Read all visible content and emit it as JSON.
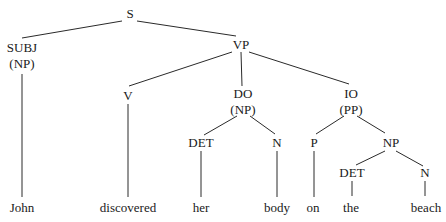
{
  "diagram": {
    "type": "syntax-tree",
    "nodes": [
      {
        "id": "S",
        "label": "S",
        "sub": "",
        "x": 130,
        "y": 18
      },
      {
        "id": "SUBJ",
        "label": "SUBJ",
        "sub": "(NP)",
        "x": 22,
        "y": 51
      },
      {
        "id": "VP",
        "label": "VP",
        "sub": "",
        "x": 241,
        "y": 49
      },
      {
        "id": "V",
        "label": "V",
        "sub": "",
        "x": 128,
        "y": 99
      },
      {
        "id": "DO",
        "label": "DO",
        "sub": "(NP)",
        "x": 243,
        "y": 98
      },
      {
        "id": "IO",
        "label": "IO",
        "sub": "(PP)",
        "x": 351,
        "y": 98
      },
      {
        "id": "DET1",
        "label": "DET",
        "sub": "",
        "x": 201,
        "y": 147
      },
      {
        "id": "N1",
        "label": "N",
        "sub": "",
        "x": 277,
        "y": 147
      },
      {
        "id": "P",
        "label": "P",
        "sub": "",
        "x": 314,
        "y": 147
      },
      {
        "id": "NP2",
        "label": "NP",
        "sub": "",
        "x": 391,
        "y": 147
      },
      {
        "id": "DET2",
        "label": "DET",
        "sub": "",
        "x": 352,
        "y": 177
      },
      {
        "id": "N2",
        "label": "N",
        "sub": "",
        "x": 425,
        "y": 177
      }
    ],
    "words": [
      {
        "id": "w-john",
        "text": "John",
        "x": 22,
        "y": 212
      },
      {
        "id": "w-discovered",
        "text": "discovered",
        "x": 128,
        "y": 212
      },
      {
        "id": "w-her",
        "text": "her",
        "x": 201,
        "y": 212
      },
      {
        "id": "w-body",
        "text": "body",
        "x": 277,
        "y": 212
      },
      {
        "id": "w-on",
        "text": "on",
        "x": 313,
        "y": 212
      },
      {
        "id": "w-the",
        "text": "the",
        "x": 351,
        "y": 212
      },
      {
        "id": "w-beach",
        "text": "beach",
        "x": 426,
        "y": 212
      }
    ],
    "edges": [
      {
        "x1": 122,
        "y1": 21,
        "x2": 22,
        "y2": 38
      },
      {
        "x1": 137,
        "y1": 21,
        "x2": 236,
        "y2": 36
      },
      {
        "x1": 232,
        "y1": 52,
        "x2": 129,
        "y2": 86
      },
      {
        "x1": 241,
        "y1": 52,
        "x2": 241,
        "y2": 86
      },
      {
        "x1": 249,
        "y1": 52,
        "x2": 349,
        "y2": 84
      },
      {
        "x1": 22,
        "y1": 74,
        "x2": 22,
        "y2": 197
      },
      {
        "x1": 128,
        "y1": 103,
        "x2": 128,
        "y2": 197
      },
      {
        "x1": 237,
        "y1": 116,
        "x2": 204,
        "y2": 135
      },
      {
        "x1": 250,
        "y1": 116,
        "x2": 275,
        "y2": 134
      },
      {
        "x1": 344,
        "y1": 116,
        "x2": 316,
        "y2": 134
      },
      {
        "x1": 357,
        "y1": 116,
        "x2": 385,
        "y2": 133
      },
      {
        "x1": 201,
        "y1": 151,
        "x2": 201,
        "y2": 197
      },
      {
        "x1": 277,
        "y1": 151,
        "x2": 277,
        "y2": 197
      },
      {
        "x1": 314,
        "y1": 151,
        "x2": 314,
        "y2": 197
      },
      {
        "x1": 385,
        "y1": 151,
        "x2": 356,
        "y2": 165
      },
      {
        "x1": 396,
        "y1": 151,
        "x2": 423,
        "y2": 166
      },
      {
        "x1": 352,
        "y1": 181,
        "x2": 352,
        "y2": 196
      },
      {
        "x1": 425,
        "y1": 181,
        "x2": 425,
        "y2": 196
      }
    ]
  },
  "labels": {
    "S": "S",
    "SUBJ": "SUBJ",
    "SUBJ_sub": "(NP)",
    "VP": "VP",
    "V": "V",
    "DO": "DO",
    "DO_sub": "(NP)",
    "IO": "IO",
    "IO_sub": "(PP)",
    "DET1": "DET",
    "N1": "N",
    "P": "P",
    "NP2": "NP",
    "DET2": "DET",
    "N2": "N",
    "w_john": "John",
    "w_discovered": "discovered",
    "w_her": "her",
    "w_body": "body",
    "w_on": "on",
    "w_the": "the",
    "w_beach": "beach"
  }
}
